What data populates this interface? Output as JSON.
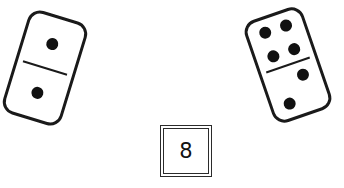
{
  "scene": {
    "title": "Domino pip counting puzzle",
    "background_color": "#ffffff",
    "ink_color": "#1a1a1a",
    "pip_color": "#111111",
    "width": 344,
    "height": 188
  },
  "dominoes": [
    {
      "name": "left-domino",
      "top_pips": 1,
      "bottom_pips": 1,
      "total": 2,
      "rotation_deg": 17,
      "notation": "1|1"
    },
    {
      "name": "right-domino",
      "top_pips": 4,
      "bottom_pips": 2,
      "total": 6,
      "rotation_deg": -19,
      "notation": "4|2"
    }
  ],
  "answer": {
    "label": "8",
    "value": 8,
    "description": "total pip count"
  }
}
